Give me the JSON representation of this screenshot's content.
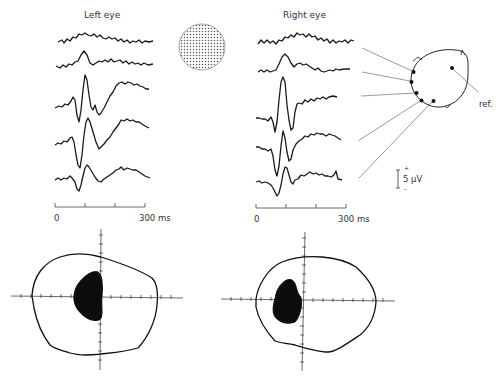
{
  "figure": {
    "panels": {
      "left": {
        "title": "Left eye",
        "time_axis": {
          "start_label": "0",
          "end_label": "300 ms",
          "ticks": [
            0,
            100,
            200,
            300
          ]
        },
        "trace_count": 5
      },
      "right": {
        "title": "Right eye",
        "time_axis": {
          "start_label": "0",
          "end_label": "300 ms",
          "ticks": [
            0,
            100,
            200,
            300
          ]
        },
        "trace_count": 5
      }
    },
    "stimulus": {
      "icon": "dotted-disc-stimulus"
    },
    "head_diagram": {
      "reference_label": "ref.",
      "electrode_count": 5
    },
    "scale_bar": {
      "label": "5 µV",
      "plus": "+",
      "minus": "–"
    },
    "visual_fields": {
      "left": {
        "scotoma_side": "central-left"
      },
      "right": {
        "scotoma_side": "central-left"
      }
    }
  }
}
